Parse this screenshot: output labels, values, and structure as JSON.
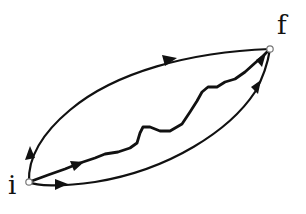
{
  "diagram": {
    "points": {
      "initial": {
        "label": "i",
        "x": 29,
        "y": 182
      },
      "final": {
        "label": "f",
        "x": 270,
        "y": 49
      }
    },
    "paths": [
      {
        "name": "upper-path",
        "style": "smooth",
        "arrows": 2
      },
      {
        "name": "middle-path",
        "style": "wiggly",
        "arrows": 2
      },
      {
        "name": "lower-path",
        "style": "smooth",
        "arrows": 2
      }
    ],
    "colors": {
      "stroke": "#111111",
      "background": "#ffffff"
    }
  }
}
